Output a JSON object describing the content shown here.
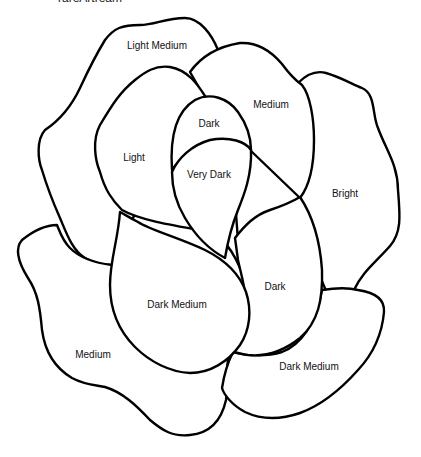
{
  "caption": "rareArtream",
  "diagram": {
    "stroke_color": "#000000",
    "fill_color": "#ffffff",
    "regions": [
      {
        "id": "outer-top-left",
        "label": "Light Medium",
        "x": 157,
        "y": 49
      },
      {
        "id": "top-right",
        "label": "Medium",
        "x": 271,
        "y": 108
      },
      {
        "id": "inner-top",
        "label": "Dark",
        "x": 209,
        "y": 127
      },
      {
        "id": "left-inner",
        "label": "Light",
        "x": 134,
        "y": 161
      },
      {
        "id": "center",
        "label": "Very Dark",
        "x": 209,
        "y": 178
      },
      {
        "id": "right",
        "label": "Bright",
        "x": 345,
        "y": 197
      },
      {
        "id": "right-inner",
        "label": "Dark",
        "x": 275,
        "y": 290
      },
      {
        "id": "center-lower",
        "label": "Dark Medium",
        "x": 177,
        "y": 308
      },
      {
        "id": "lower-left",
        "label": "Medium",
        "x": 93,
        "y": 358
      },
      {
        "id": "lower-right",
        "label": "Dark Medium",
        "x": 309,
        "y": 370
      }
    ]
  }
}
